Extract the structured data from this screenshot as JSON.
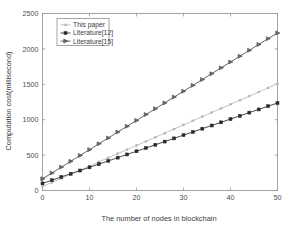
{
  "chart_data": {
    "type": "line",
    "title": "",
    "xlabel": "The number of nodes in blockchain",
    "ylabel": "Computation cost(millisecond)",
    "xlim": [
      0,
      50
    ],
    "ylim": [
      0,
      2500
    ],
    "xticks": [
      "0",
      "10",
      "20",
      "30",
      "40",
      "50"
    ],
    "xtick_values": [
      0,
      10,
      20,
      30,
      40,
      50
    ],
    "yticks": [
      "0",
      "500",
      "1000",
      "1500",
      "2000",
      "2500"
    ],
    "ytick_values": [
      0,
      500,
      1000,
      1500,
      2000,
      2500
    ],
    "grid": false,
    "legend_position": "upper left",
    "x": [
      0,
      2,
      4,
      6,
      8,
      10,
      12,
      14,
      16,
      18,
      20,
      22,
      24,
      26,
      28,
      30,
      32,
      34,
      36,
      38,
      40,
      42,
      44,
      46,
      48,
      50
    ],
    "series": [
      {
        "name": "This paper",
        "marker": "asterisk",
        "color": "#b8b8b8",
        "values": [
          55,
          113,
          171,
          229,
          287,
          345,
          404,
          462,
          520,
          578,
          636,
          694,
          752,
          810,
          868,
          926,
          985,
          1043,
          1101,
          1159,
          1217,
          1275,
          1333,
          1391,
          1449,
          1510
        ]
      },
      {
        "name": "Literature[12]",
        "marker": "square",
        "color": "#2b2b2b",
        "values": [
          100,
          145,
          191,
          236,
          282,
          327,
          373,
          418,
          464,
          509,
          554,
          600,
          645,
          691,
          736,
          782,
          827,
          873,
          918,
          963,
          1009,
          1054,
          1100,
          1145,
          1191,
          1235
        ]
      },
      {
        "name": "Literature[15]",
        "marker": "triangle-right",
        "color": "#4a4a4a",
        "values": [
          165,
          247,
          330,
          412,
          495,
          577,
          660,
          742,
          825,
          907,
          990,
          1072,
          1155,
          1237,
          1320,
          1402,
          1485,
          1567,
          1650,
          1732,
          1815,
          1897,
          1980,
          2062,
          2145,
          2225
        ]
      }
    ]
  },
  "legend": {
    "entries": [
      {
        "label": "This paper"
      },
      {
        "label": "Literature[12]"
      },
      {
        "label": "Literature[15]"
      }
    ]
  },
  "colors": {
    "axis": "#9a9a9a",
    "background": "#ffffff",
    "this_paper": "#b8b8b8",
    "literature12": "#2b2b2b",
    "literature15": "#4a4a4a"
  }
}
